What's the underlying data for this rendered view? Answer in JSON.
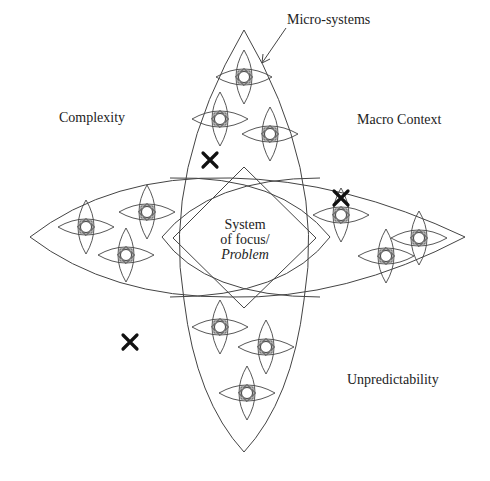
{
  "diagram": {
    "labels": {
      "micro_systems": "Micro-systems",
      "complexity": "Complexity",
      "macro_context": "Macro Context",
      "unpredictability": "Unpredictability",
      "center_line1": "System",
      "center_line2": "of focus/",
      "center_line3": "Problem"
    },
    "micro_system_groups": {
      "top": [
        [
          244,
          77
        ],
        [
          220,
          119
        ],
        [
          270,
          134
        ]
      ],
      "left": [
        [
          86,
          227
        ],
        [
          147,
          212
        ],
        [
          126,
          255
        ]
      ],
      "right": [
        [
          341,
          215
        ],
        [
          386,
          256
        ],
        [
          419,
          238
        ]
      ],
      "bottom": [
        [
          220,
          327
        ],
        [
          266,
          347
        ],
        [
          247,
          393
        ]
      ]
    },
    "x_marks": [
      [
        210,
        160
      ],
      [
        341,
        198
      ],
      [
        130,
        342
      ]
    ],
    "colors": {
      "line": "#444444",
      "mark": "#111111",
      "background": "#ffffff"
    }
  }
}
